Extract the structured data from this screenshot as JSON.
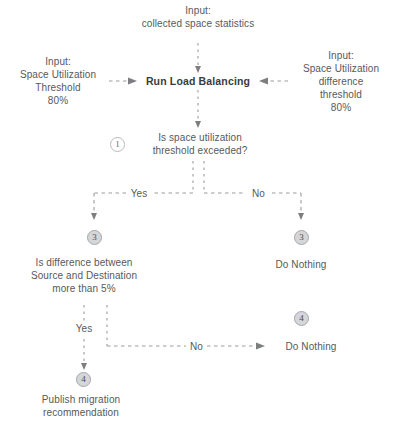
{
  "diagram": {
    "colors": {
      "text": "#58595b",
      "line": "#9b9c9e",
      "badge_fill": "#d5d6d7",
      "badge_stroke": "#a7a8aa"
    },
    "nodes": {
      "input_top": "Input:\ncollected space statistics",
      "input_left": "Input:\nSpace Utilization\nThreshold\n80%",
      "input_right": "Input:\nSpace Utilization\ndifference\nthreshold\n80%",
      "process_main": "Run Load Balancing",
      "decision_one": "Is space utilization\nthreshold exceeded?",
      "decision_two": "Is difference between\nSource and Destination\nmore than 5%",
      "do_nothing_right": "Do Nothing",
      "do_nothing_bottom": "Do Nothing",
      "publish": "Publish migration\nrecommendation"
    },
    "badges": {
      "one": "1",
      "three_left": "3",
      "three_right": "3",
      "four_right": "4",
      "four_bottom": "4"
    },
    "edge_labels": {
      "yes_top": "Yes",
      "no_top": "No",
      "yes_bottom": "Yes",
      "no_bottom": "No"
    }
  }
}
